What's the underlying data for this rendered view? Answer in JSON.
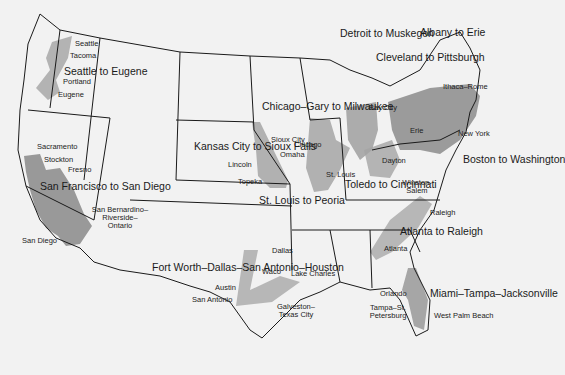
{
  "map": {
    "subject": "United States urban corridors (megalopolis regions)",
    "colors": {
      "background": "#f2f2f2",
      "border": "#1a1a1a",
      "urban_light": "#b8b8b8",
      "urban_dark": "#8a8a8a"
    },
    "regions": [
      {
        "id": "seattle-eugene",
        "label": "Seattle to Eugene"
      },
      {
        "id": "sf-sandiego",
        "label": "San Francisco to San Diego"
      },
      {
        "id": "kc-siouxfalls",
        "label": "Kansas City to Sioux Falls"
      },
      {
        "id": "chicago-milwaukee",
        "label": "Chicago–Gary to Milwaukee"
      },
      {
        "id": "detroit-muskegon",
        "label": "Detroit to Muskegon"
      },
      {
        "id": "cleveland-pittsburgh",
        "label": "Cleveland to Pittsburgh"
      },
      {
        "id": "albany-erie",
        "label": "Albany to Erie"
      },
      {
        "id": "boston-washington",
        "label": "Boston to Washington"
      },
      {
        "id": "stlouis-peoria",
        "label": "St. Louis to Peoria"
      },
      {
        "id": "toledo-cincinnati",
        "label": "Toledo to Cincinnati"
      },
      {
        "id": "atlanta-raleigh",
        "label": "Atlanta to Raleigh"
      },
      {
        "id": "texas",
        "label": "Fort Worth–Dallas–San Antonio–Houston"
      },
      {
        "id": "florida",
        "label": "Miami–Tampa–Jacksonville"
      }
    ],
    "cities": [
      "Seattle",
      "Tacoma",
      "Portland",
      "Eugene",
      "Sacramento",
      "Stockton",
      "Fresno",
      "San Bernardino–Riverside–Ontario",
      "San Diego",
      "Sioux City",
      "Omaha",
      "Lincoln",
      "Topeka",
      "Chicago",
      "St. Louis",
      "Bay City",
      "Dayton",
      "Erie",
      "Ithaca–Rome",
      "New York",
      "Winston-Salem",
      "Raleigh",
      "Atlanta",
      "Dallas",
      "Waco",
      "Austin",
      "San Antonio",
      "Lake Charles",
      "Galveston–Texas City",
      "Orlando",
      "Tampa–St. Petersburg",
      "West Palm Beach"
    ]
  }
}
